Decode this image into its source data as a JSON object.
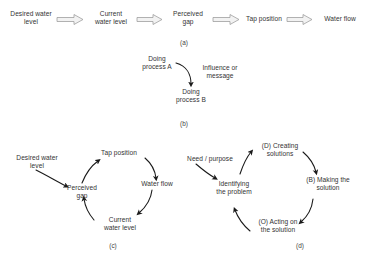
{
  "figure": {
    "background": "#ffffff",
    "text_color": "#333333",
    "arrow_color": "#8c8c8c",
    "thin_arrow_color": "#1a1a1a",
    "panels": [
      {
        "id": "a",
        "caption": "(a)",
        "type": "linear-chain",
        "nodes": [
          {
            "id": "a-desired",
            "label": "Desired water\nlevel"
          },
          {
            "id": "a-current",
            "label": "Current\nwater level"
          },
          {
            "id": "a-gap",
            "label": "Perceived\ngap"
          },
          {
            "id": "a-tap",
            "label": "Tap position"
          },
          {
            "id": "a-flow",
            "label": "Water flow"
          }
        ],
        "links": [
          {
            "from": "a-desired",
            "to": "a-current",
            "style": "block-arrow"
          },
          {
            "from": "a-current",
            "to": "a-gap",
            "style": "block-arrow"
          },
          {
            "from": "a-gap",
            "to": "a-tap",
            "style": "block-arrow"
          },
          {
            "from": "a-tap",
            "to": "a-flow",
            "style": "block-arrow"
          }
        ]
      },
      {
        "id": "b",
        "caption": "(b)",
        "type": "single-link",
        "nodes": [
          {
            "id": "b-process-a",
            "label": "Doing\nprocess A"
          },
          {
            "id": "b-process-b",
            "label": "Doing\nprocess B"
          }
        ],
        "edge_label": "Influence or\nmessage",
        "links": [
          {
            "from": "b-process-a",
            "to": "b-process-b",
            "style": "curved-arrow"
          }
        ]
      },
      {
        "id": "c",
        "caption": "(c)",
        "type": "feedback-loop",
        "external_input": "Desired water\nlevel",
        "nodes": [
          {
            "id": "c-gap",
            "label": "Perceived\ngap"
          },
          {
            "id": "c-tap",
            "label": "Tap position"
          },
          {
            "id": "c-flow",
            "label": "Water flow"
          },
          {
            "id": "c-current",
            "label": "Current\nwater level"
          }
        ],
        "links": [
          {
            "from": "c-external",
            "to": "c-gap",
            "style": "curved-arrow"
          },
          {
            "from": "c-gap",
            "to": "c-tap",
            "style": "curved-arrow"
          },
          {
            "from": "c-tap",
            "to": "c-flow",
            "style": "curved-arrow"
          },
          {
            "from": "c-flow",
            "to": "c-current",
            "style": "curved-arrow"
          },
          {
            "from": "c-current",
            "to": "c-gap",
            "style": "curved-arrow"
          }
        ]
      },
      {
        "id": "d",
        "caption": "(d)",
        "type": "feedback-loop",
        "external_input": "Need / purpose",
        "nodes": [
          {
            "id": "d-identify",
            "label": "Identifying\nthe problem"
          },
          {
            "id": "d-create",
            "label": "(D) Creating\nsolutions"
          },
          {
            "id": "d-make",
            "label": "(B) Making the\nsolution"
          },
          {
            "id": "d-act",
            "label": "(O) Acting on\nthe solution"
          }
        ],
        "links": [
          {
            "from": "d-external",
            "to": "d-identify",
            "style": "curved-arrow"
          },
          {
            "from": "d-identify",
            "to": "d-create",
            "style": "curved-arrow"
          },
          {
            "from": "d-create",
            "to": "d-make",
            "style": "curved-arrow"
          },
          {
            "from": "d-make",
            "to": "d-act",
            "style": "curved-arrow"
          },
          {
            "from": "d-act",
            "to": "d-identify",
            "style": "curved-arrow"
          }
        ]
      }
    ]
  }
}
